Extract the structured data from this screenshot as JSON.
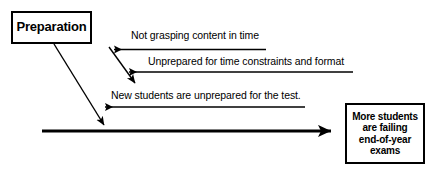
{
  "diagram": {
    "type": "cause-and-effect",
    "background_color": "#ffffff",
    "line_color": "#000000",
    "cause_box": {
      "label": "Preparation"
    },
    "effect_box": {
      "label": "More students are failing end-of-year exams",
      "lines": [
        "More students",
        "are failing",
        "end-of-year",
        "exams"
      ]
    },
    "ribs": [
      {
        "label": "Not grasping content in time"
      },
      {
        "label": "Unprepared for time constraints and format"
      },
      {
        "label": "New students are unprepared for the test."
      }
    ]
  }
}
